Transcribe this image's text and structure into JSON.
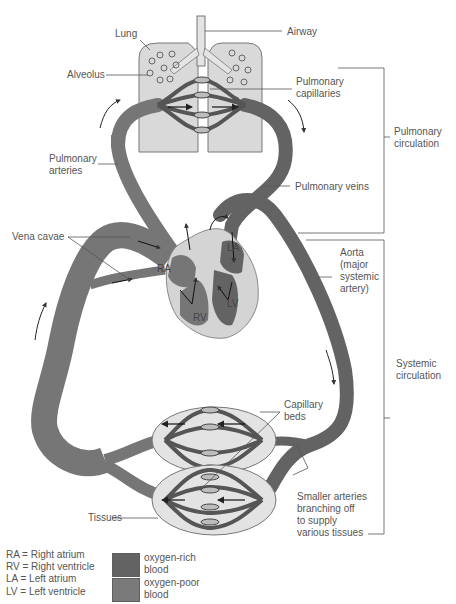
{
  "labels": {
    "lung": "Lung",
    "airway": "Airway",
    "alveolus": "Alveolus",
    "pulmonary_capillaries": [
      "Pulmonary",
      "capillaries"
    ],
    "pulmonary_arteries": [
      "Pulmonary",
      "arteries"
    ],
    "pulmonary_veins": "Pulmonary veins",
    "pulmonary_circulation": [
      "Pulmonary",
      "circulation"
    ],
    "vena_cavae": "Vena cavae",
    "aorta": [
      "Aorta",
      "(major",
      "systemic",
      "artery)"
    ],
    "systemic_circulation": [
      "Systemic",
      "circulation"
    ],
    "capillary_beds": [
      "Capillary",
      "beds"
    ],
    "smaller_arteries": [
      "Smaller arteries",
      "branching off",
      "to supply",
      "various tissues"
    ],
    "tissues": "Tissues"
  },
  "heart": {
    "ra": "RA",
    "rv": "RV",
    "la": "LA",
    "lv": "LV"
  },
  "legend": {
    "abbreviations": [
      "RA = Right atrium",
      "RV = Right ventricle",
      "LA = Left atrium",
      "LV = Left ventricle"
    ],
    "items": [
      {
        "label": [
          "oxygen-rich",
          "blood"
        ],
        "color": "#636363"
      },
      {
        "label": [
          "oxygen-poor",
          "blood"
        ],
        "color": "#7a7a7a"
      }
    ]
  },
  "colors": {
    "oxygen_rich": "#636363",
    "oxygen_poor": "#767676",
    "lung_fill": "#d9d9d9",
    "tissue_fill": "#e3e3e3",
    "heart_wall": "#d4d4d4",
    "line": "#555555"
  }
}
